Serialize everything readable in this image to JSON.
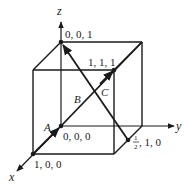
{
  "diagram": {
    "type": "unit-cube-crystallographic-directions",
    "axes": {
      "x": "x",
      "y": "y",
      "z": "z"
    },
    "points": {
      "origin": "0, 0, 0",
      "z_unit": "0, 0, 1",
      "x_unit": "1, 0, 0",
      "body_diagonal": "1, 1, 1",
      "half_one_zero_rest": ", 1, 0",
      "half_num": "1",
      "half_den": "2"
    },
    "directions": {
      "A": "A",
      "B": "B",
      "C": "C"
    },
    "colors": {
      "line": "#1a1a1a",
      "background": "#ffffff"
    }
  }
}
